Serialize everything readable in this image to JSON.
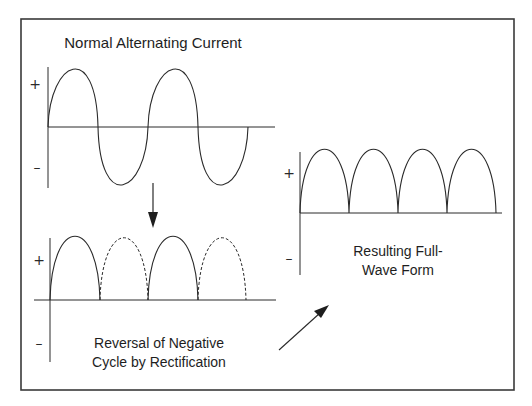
{
  "diagram": {
    "colors": {
      "line": "#2a2a2a",
      "text": "#1e1e1e",
      "frame": "#3a3a3a",
      "background": "#ffffff"
    },
    "panels": [
      {
        "id": "ac",
        "label": "Normal Alternating Current",
        "plus": "+",
        "minus": "–"
      },
      {
        "id": "reversal",
        "label_line1": "Reversal of Negative",
        "label_line2": "Cycle by Rectification",
        "plus": "+",
        "minus": "–"
      },
      {
        "id": "fullwave",
        "label_line1": "Resulting Full-",
        "label_line2": "Wave Form",
        "plus": "+",
        "minus": "–"
      }
    ],
    "arrows": [
      {
        "from": "ac",
        "to": "reversal",
        "direction": "down"
      },
      {
        "from": "reversal",
        "to": "fullwave",
        "direction": "up-right"
      }
    ]
  }
}
